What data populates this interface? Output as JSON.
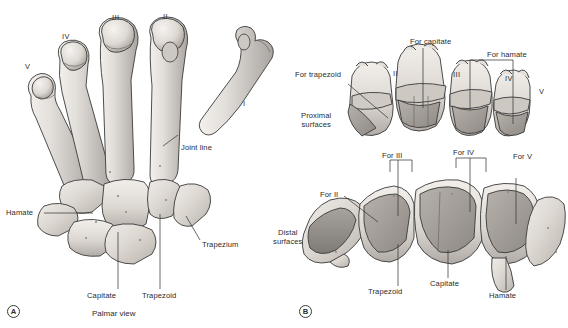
{
  "figure": {
    "background_color": "#ffffff",
    "ink_color": "#2b2b2b",
    "bone_fill_light": "#ded9d4",
    "bone_fill_mid": "#c3bfba",
    "bone_fill_dark": "#a09c98",
    "outline_color": "#3a3a3a"
  },
  "panels": [
    {
      "id": "A",
      "marker": "A",
      "caption": "Palmar view",
      "metacarpal_numerals": [
        "V",
        "IV",
        "III",
        "II",
        "I"
      ],
      "labels": [
        "Joint line",
        "Hamate",
        "Capitate",
        "Trapezoid",
        "Trapezium"
      ]
    },
    {
      "id": "B",
      "marker": "B",
      "groups": [
        {
          "name": "proximal",
          "side_label": "Proximal\nsurfaces",
          "numerals": [
            "II",
            "III",
            "IV",
            "V"
          ],
          "callouts": [
            "For trapezoid",
            "For capitate",
            "For hamate"
          ]
        },
        {
          "name": "distal",
          "side_label": "Distal\nsurfaces",
          "callouts": [
            "For II",
            "For III",
            "For IV",
            "For V"
          ],
          "bone_labels": [
            "Trapezoid",
            "Capitate",
            "Hamate"
          ]
        }
      ]
    }
  ],
  "panel_a": {
    "marker": "A",
    "caption": "Palmar view",
    "numeral_v": "V",
    "numeral_iv": "IV",
    "numeral_iii": "III",
    "numeral_ii": "II",
    "numeral_i": "I",
    "joint_line": "Joint line",
    "hamate": "Hamate",
    "capitate": "Capitate",
    "trapezoid": "Trapezoid",
    "trapezium": "Trapezium"
  },
  "panel_b": {
    "marker": "B",
    "proximal_surfaces": "Proximal\nsurfaces",
    "distal_surfaces": "Distal\nsurfaces",
    "for_trapezoid": "For trapezoid",
    "for_capitate": "For capitate",
    "for_hamate": "For hamate",
    "numeral_ii": "II",
    "numeral_iii": "III",
    "numeral_iv": "IV",
    "numeral_v": "V",
    "for_ii": "For II",
    "for_iii": "For III",
    "for_iv": "For IV",
    "for_v": "For V",
    "trapezoid": "Trapezoid",
    "capitate": "Capitate",
    "hamate": "Hamate"
  }
}
